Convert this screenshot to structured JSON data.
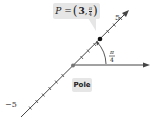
{
  "diagram": {
    "point_label": "P = (3, π/4)",
    "point_label_parts": {
      "prefix": "P = ",
      "r": "3",
      "theta_num": "π",
      "theta_den": "4"
    },
    "pole_label": "Pole",
    "angle_label": {
      "num": "π",
      "den": "4"
    },
    "tick_label_positive": "5",
    "tick_label_negative": "−5",
    "point": {
      "r": 3,
      "theta": "π/4"
    },
    "axis_range": [
      -5,
      5
    ],
    "colors": {
      "line": "#333333",
      "callout": "#e6e6e6",
      "point": "#111111"
    }
  }
}
